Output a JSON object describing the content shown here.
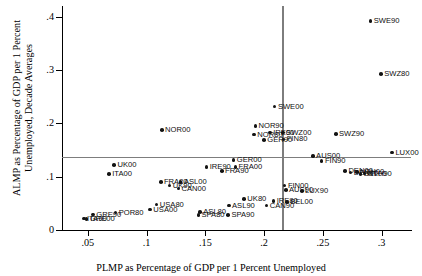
{
  "chart_data": {
    "type": "scatter",
    "title": "",
    "xlabel": "PLMP as Percentage of GDP per 1 Percent Unemployed",
    "ylabel": "ALMP as Percentage of GDP per 1 Percent Unemployed, Decade Averages",
    "xlim": [
      0.028,
      0.325
    ],
    "ylim": [
      0.0,
      0.42
    ],
    "xticks": [
      ".05",
      ".1",
      ".15",
      ".2",
      ".25",
      ".3"
    ],
    "xtickvals": [
      0.05,
      0.1,
      0.15,
      0.2,
      0.25,
      0.3
    ],
    "yticks": [
      "0",
      ".1",
      ".2",
      ".3",
      ".4"
    ],
    "ytickvals": [
      0.0,
      0.1,
      0.2,
      0.3,
      0.4
    ],
    "grid": false,
    "legend": "none",
    "reference_lines": [
      {
        "orientation": "vertical",
        "value": 0.2155,
        "color": "#7d7d7d"
      },
      {
        "orientation": "horizontal",
        "value": 0.1375,
        "color": "#7d7d7d"
      }
    ],
    "marker_color": "#141414",
    "points": [
      {
        "label": "SWE90",
        "x": 0.2905,
        "y": 0.392,
        "lpos": "right"
      },
      {
        "label": "SWZ80",
        "x": 0.2995,
        "y": 0.292,
        "lpos": "right"
      },
      {
        "label": "SWE00",
        "x": 0.209,
        "y": 0.2315,
        "lpos": "right"
      },
      {
        "label": "NOR90",
        "x": 0.1925,
        "y": 0.1955,
        "lpos": "right"
      },
      {
        "label": "NOR00",
        "x": 0.113,
        "y": 0.188,
        "lpos": "right"
      },
      {
        "label": "IRE00",
        "x": 0.205,
        "y": 0.183,
        "lpos": "right"
      },
      {
        "label": "SWZ00",
        "x": 0.216,
        "y": 0.183,
        "lpos": "right"
      },
      {
        "label": "NOR80",
        "x": 0.1915,
        "y": 0.179,
        "lpos": "right"
      },
      {
        "label": "SWZ90",
        "x": 0.261,
        "y": 0.1795,
        "lpos": "right"
      },
      {
        "label": "GER90",
        "x": 0.2,
        "y": 0.169,
        "lpos": "right"
      },
      {
        "label": "FIN80",
        "x": 0.2165,
        "y": 0.17,
        "lpos": "right"
      },
      {
        "label": "LUX00",
        "x": 0.309,
        "y": 0.145,
        "lpos": "right"
      },
      {
        "label": "AUS00",
        "x": 0.2415,
        "y": 0.139,
        "lpos": "right"
      },
      {
        "label": "GER00",
        "x": 0.174,
        "y": 0.131,
        "lpos": "right"
      },
      {
        "label": "FIN90",
        "x": 0.249,
        "y": 0.1295,
        "lpos": "right"
      },
      {
        "label": "UK00",
        "x": 0.0725,
        "y": 0.1215,
        "lpos": "right"
      },
      {
        "label": "IRE90",
        "x": 0.151,
        "y": 0.118,
        "lpos": "right"
      },
      {
        "label": "FRA00",
        "x": 0.1755,
        "y": 0.1185,
        "lpos": "right"
      },
      {
        "label": "FRA90",
        "x": 0.164,
        "y": 0.1105,
        "lpos": "right"
      },
      {
        "label": "ITA00",
        "x": 0.068,
        "y": 0.1045,
        "lpos": "right"
      },
      {
        "label": "DEN00",
        "x": 0.269,
        "y": 0.111,
        "lpos": "right"
      },
      {
        "label": "NTH00",
        "x": 0.279,
        "y": 0.109,
        "lpos": "right"
      },
      {
        "label": "NTH90",
        "x": 0.2855,
        "y": 0.106,
        "lpos": "right"
      },
      {
        "label": "DEN90",
        "x": 0.2735,
        "y": 0.1075,
        "lpos": "right"
      },
      {
        "label": "BEL00",
        "x": 0.282,
        "y": 0.1045,
        "lpos": "right"
      },
      {
        "label": "FRA80",
        "x": 0.112,
        "y": 0.0905,
        "lpos": "right"
      },
      {
        "label": "ASL00",
        "x": 0.129,
        "y": 0.0905,
        "lpos": "right"
      },
      {
        "label": "UK90",
        "x": 0.1195,
        "y": 0.0835,
        "lpos": "right"
      },
      {
        "label": "CAN00",
        "x": 0.127,
        "y": 0.078,
        "lpos": "right"
      },
      {
        "label": "FIN00",
        "x": 0.2175,
        "y": 0.0835,
        "lpos": "right"
      },
      {
        "label": "AUS90",
        "x": 0.2185,
        "y": 0.0745,
        "lpos": "right"
      },
      {
        "label": "LUX90",
        "x": 0.232,
        "y": 0.0735,
        "lpos": "right"
      },
      {
        "label": "UK80",
        "x": 0.183,
        "y": 0.058,
        "lpos": "right"
      },
      {
        "label": "IRE80",
        "x": 0.208,
        "y": 0.0545,
        "lpos": "right"
      },
      {
        "label": "BEL00b",
        "x": 0.2195,
        "y": 0.052,
        "lpos": "right"
      },
      {
        "label": "CAN90",
        "x": 0.202,
        "y": 0.046,
        "lpos": "right"
      },
      {
        "label": "ASL90",
        "x": 0.17,
        "y": 0.046,
        "lpos": "right"
      },
      {
        "label": "USA80",
        "x": 0.1085,
        "y": 0.048,
        "lpos": "right"
      },
      {
        "label": "USA00",
        "x": 0.103,
        "y": 0.0385,
        "lpos": "right"
      },
      {
        "label": "ASL80",
        "x": 0.1455,
        "y": 0.0335,
        "lpos": "right"
      },
      {
        "label": "SPA80",
        "x": 0.144,
        "y": 0.0285,
        "lpos": "right"
      },
      {
        "label": "SPA90",
        "x": 0.1695,
        "y": 0.0285,
        "lpos": "right"
      },
      {
        "label": "GRE90",
        "x": 0.0545,
        "y": 0.029,
        "lpos": "right"
      },
      {
        "label": "POR80",
        "x": 0.0735,
        "y": 0.033,
        "lpos": "right"
      },
      {
        "label": "GRE00",
        "x": 0.049,
        "y": 0.0205,
        "lpos": "right"
      },
      {
        "label": "ITA90",
        "x": 0.0465,
        "y": 0.0215,
        "lpos": "right"
      }
    ]
  }
}
